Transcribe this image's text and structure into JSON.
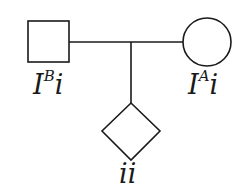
{
  "diagram": {
    "type": "pedigree",
    "colors": {
      "stroke": "#1a1a1a",
      "background": "#ffffff"
    },
    "individuals": [
      {
        "id": "father",
        "shape": "square",
        "sex": "male",
        "genotype_base": "I",
        "genotype_sup": "B",
        "genotype_tail": "i"
      },
      {
        "id": "mother",
        "shape": "circle",
        "sex": "female",
        "genotype_base": "I",
        "genotype_sup": "A",
        "genotype_tail": "i"
      },
      {
        "id": "child",
        "shape": "diamond",
        "sex": "unknown",
        "genotype": "ii"
      }
    ],
    "relationships": [
      {
        "type": "mating-line",
        "between": [
          "father",
          "mother"
        ]
      },
      {
        "type": "descent-line",
        "from": "mating-line",
        "to": "child"
      }
    ]
  }
}
